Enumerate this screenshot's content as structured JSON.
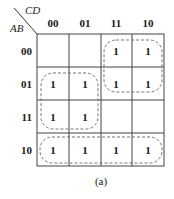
{
  "kmap": {
    "row_variable": "AB",
    "col_variable": "CD",
    "col_labels": [
      "00",
      "01",
      "11",
      "10"
    ],
    "row_labels": [
      "00",
      "01",
      "11",
      "10"
    ],
    "cells": [
      [
        "",
        "",
        "1",
        "1"
      ],
      [
        "1",
        "1",
        "1",
        "1"
      ],
      [
        "1",
        "1",
        "",
        ""
      ],
      [
        "1",
        "1",
        "1",
        "1"
      ]
    ],
    "groups": [
      {
        "name": "group-cd-1x",
        "rows": [
          0,
          1
        ],
        "cols": [
          2,
          3
        ]
      },
      {
        "name": "group-ab-01-11-c0",
        "rows": [
          1,
          2
        ],
        "cols": [
          0,
          1
        ]
      },
      {
        "name": "group-ab-10",
        "rows": [
          3
        ],
        "cols": [
          0,
          1,
          2,
          3
        ]
      }
    ]
  },
  "caption": "(a)"
}
